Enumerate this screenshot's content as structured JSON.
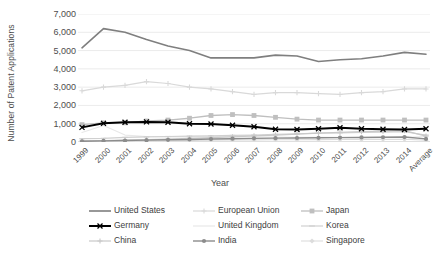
{
  "chart_data": {
    "type": "line",
    "title": "",
    "xlabel": "Year",
    "ylabel": "Number of Patent Applications",
    "ylim": [
      0,
      7000
    ],
    "ytick_labels": [
      "7,000",
      "6,000",
      "5,000",
      "4,000",
      "3,000",
      "2,000",
      "1,000",
      "0"
    ],
    "ytick_values": [
      7000,
      6000,
      5000,
      4000,
      3000,
      2000,
      1000,
      0
    ],
    "grid": true,
    "legend_position": "bottom",
    "categories": [
      "1999",
      "2000",
      "2001",
      "2002",
      "2003",
      "2004",
      "2005",
      "2006",
      "2007",
      "2008",
      "2009",
      "2010",
      "2011",
      "2012",
      "2013",
      "2014",
      "Average"
    ],
    "series": [
      {
        "name": "United States",
        "color": "#7f7f7f",
        "marker": "none",
        "width": 1.6,
        "values": [
          5150,
          6200,
          6000,
          5600,
          5250,
          5000,
          4600,
          4600,
          4600,
          4750,
          4700,
          4400,
          4500,
          4550,
          4700,
          4900,
          4800
        ]
      },
      {
        "name": "European Union",
        "color": "#d9d9d9",
        "marker": "plus",
        "width": 1.2,
        "values": [
          2800,
          3000,
          3100,
          3300,
          3200,
          3000,
          2900,
          2750,
          2600,
          2700,
          2700,
          2650,
          2600,
          2700,
          2750,
          2900,
          2900
        ]
      },
      {
        "name": "Japan",
        "color": "#bfbfbf",
        "marker": "square",
        "width": 1.3,
        "values": [
          950,
          1050,
          1050,
          1150,
          1200,
          1300,
          1450,
          1500,
          1450,
          1350,
          1250,
          1200,
          1200,
          1200,
          1200,
          1200,
          1200
        ]
      },
      {
        "name": "Germany",
        "color": "#000000",
        "marker": "x",
        "width": 2.0,
        "values": [
          800,
          1020,
          1080,
          1100,
          1080,
          1000,
          980,
          920,
          830,
          700,
          680,
          720,
          780,
          720,
          700,
          680,
          720
        ]
      },
      {
        "name": "United Kingdom",
        "color": "#e8e8e8",
        "marker": "none",
        "width": 1.2,
        "values": [
          520,
          900,
          380,
          300,
          280,
          280,
          300,
          300,
          280,
          270,
          260,
          250,
          250,
          250,
          250,
          250,
          300
        ]
      },
      {
        "name": "Korea",
        "color": "#d0d0d0",
        "marker": "dash",
        "width": 1.2,
        "values": [
          180,
          200,
          250,
          280,
          300,
          320,
          340,
          360,
          380,
          420,
          450,
          480,
          500,
          520,
          540,
          560,
          380
        ]
      },
      {
        "name": "China",
        "color": "#c8c8c8",
        "marker": "plus",
        "width": 1.2,
        "values": [
          60,
          80,
          100,
          130,
          160,
          200,
          240,
          280,
          330,
          380,
          430,
          480,
          530,
          570,
          600,
          620,
          320
        ]
      },
      {
        "name": "India",
        "color": "#8c8c8c",
        "marker": "dot",
        "width": 1.4,
        "values": [
          40,
          60,
          80,
          100,
          120,
          140,
          160,
          180,
          200,
          210,
          220,
          230,
          240,
          250,
          260,
          270,
          170
        ]
      },
      {
        "name": "Singapore",
        "color": "#dcdcdc",
        "marker": "diamond",
        "width": 1.1,
        "values": [
          30,
          45,
          60,
          70,
          80,
          90,
          100,
          110,
          115,
          120,
          125,
          130,
          135,
          140,
          145,
          150,
          100
        ]
      }
    ]
  },
  "axis": {
    "y_title": "Number of Patent Applications",
    "x_title": "Year"
  },
  "legend": {
    "items": [
      {
        "label": "United States",
        "col": 0,
        "row": 0
      },
      {
        "label": "European Union",
        "col": 1,
        "row": 0
      },
      {
        "label": "Japan",
        "col": 2,
        "row": 0
      },
      {
        "label": "Germany",
        "col": 0,
        "row": 1
      },
      {
        "label": "United Kingdom",
        "col": 1,
        "row": 1
      },
      {
        "label": "Korea",
        "col": 2,
        "row": 1
      },
      {
        "label": "China",
        "col": 0,
        "row": 2
      },
      {
        "label": "India",
        "col": 1,
        "row": 2
      },
      {
        "label": "Singapore",
        "col": 2,
        "row": 2
      }
    ]
  }
}
